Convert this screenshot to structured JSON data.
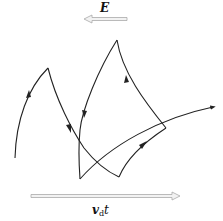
{
  "diagram": {
    "field_label": "E",
    "drift_label_main": "v",
    "drift_label_sub": "d",
    "drift_label_tail": "t",
    "colors": {
      "trajectory": "#222222",
      "vector_outline": "#aaaaaa",
      "vector_fill": "#f2f2f2"
    },
    "field_vector": {
      "direction": "left",
      "x1": 127,
      "x2": 84,
      "y": 19
    },
    "drift_vector": {
      "direction": "right",
      "x1": 31,
      "x2": 180,
      "y": 196
    }
  }
}
